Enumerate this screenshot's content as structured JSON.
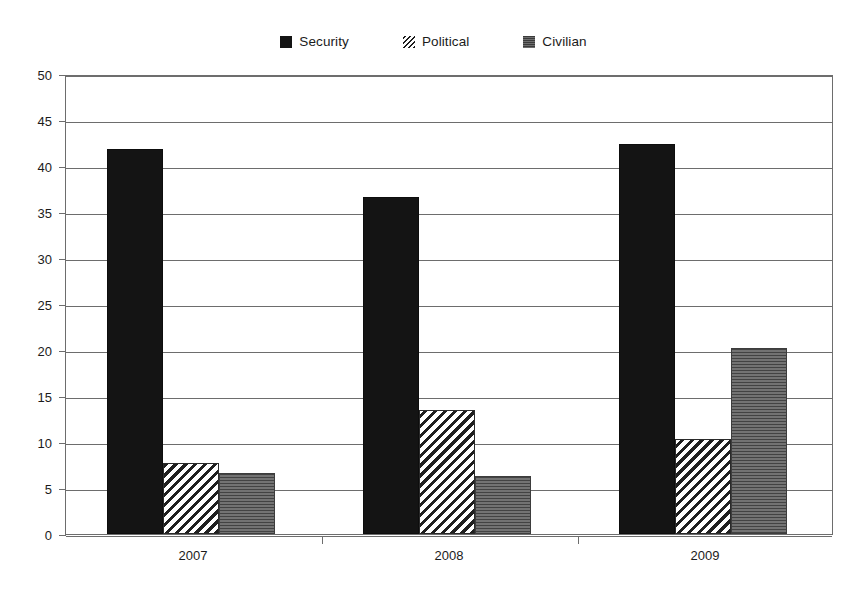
{
  "chart_data": {
    "type": "bar",
    "title": "",
    "xlabel": "",
    "ylabel": "",
    "categories": [
      "2007",
      "2008",
      "2009"
    ],
    "series": [
      {
        "name": "Security",
        "pattern": "solid-black",
        "color": "#141414",
        "values": [
          41.8,
          36.6,
          42.4
        ]
      },
      {
        "name": "Political",
        "pattern": "diagonal-hatch",
        "color": "#ffffff",
        "values": [
          7.7,
          13.5,
          10.3
        ]
      },
      {
        "name": "Civilian",
        "pattern": "horizontal-lines",
        "color": "#5e5e5e",
        "values": [
          6.6,
          6.3,
          20.2
        ]
      }
    ],
    "ylim": [
      0,
      50
    ],
    "ytick_step": 5,
    "yticks": [
      "0",
      "5",
      "10",
      "15",
      "20",
      "25",
      "30",
      "35",
      "40",
      "45",
      "50"
    ],
    "grid": "horizontal",
    "legend_position": "top-center",
    "axis_color": "#6d6d6d",
    "background": "#ffffff"
  },
  "legend": {
    "items": [
      {
        "label": "Security"
      },
      {
        "label": "Political"
      },
      {
        "label": "Civilian"
      }
    ]
  }
}
